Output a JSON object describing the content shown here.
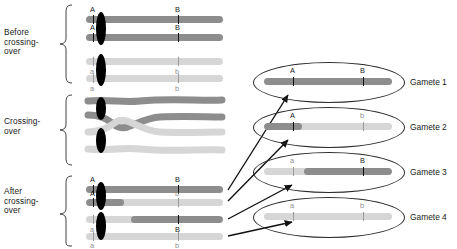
{
  "figure": {
    "type": "meiosis-crossing-over-diagram",
    "stages": [
      {
        "id": "before",
        "label": "Before\ncrossing-\nover"
      },
      {
        "id": "during",
        "label": "Crossing-\nover"
      },
      {
        "id": "after",
        "label": "After\ncrossing-\nover"
      }
    ],
    "loci": [
      {
        "name": "A",
        "dominant": "A",
        "recessive": "a"
      },
      {
        "name": "B",
        "dominant": "B",
        "recessive": "b"
      }
    ],
    "colors": {
      "dark_chromatid": "#8d8d8d",
      "light_chromatid": "#d6d6d6",
      "centromere": "#000000",
      "outline": "#2b2b2b",
      "text": "#1a1a1a",
      "faint_text": "#8e8e8e"
    },
    "before_chromatids": [
      {
        "id": "b1",
        "shade": "dark",
        "allele_a": "A",
        "allele_b": "B",
        "a_label_above": true,
        "b_label_above": true
      },
      {
        "id": "b2",
        "shade": "dark",
        "allele_a": "A",
        "allele_b": "B",
        "a_label_above": true,
        "b_label_above": true
      },
      {
        "id": "b3",
        "shade": "light",
        "allele_a": "a",
        "allele_b": "b",
        "a_label_above": false,
        "b_label_above": false
      },
      {
        "id": "b4",
        "shade": "light",
        "allele_a": "a",
        "allele_b": "b",
        "a_label_above": false,
        "b_label_above": false
      }
    ],
    "after_chromatids": [
      {
        "id": "a1",
        "label_top": "A",
        "label_bottom": "",
        "label_top_right": "B",
        "label_bottom_right": "",
        "description": "parental A B, all dark"
      },
      {
        "id": "a2",
        "label_top": "A",
        "label_bottom": "",
        "label_top_right": "",
        "label_bottom_right": "b",
        "description": "recombinant A b, dark at left, light to the right"
      },
      {
        "id": "a3",
        "label_top": "",
        "label_bottom": "a",
        "label_top_right": "B",
        "label_bottom_right": "",
        "description": "recombinant a B, light at left, dark to the right"
      },
      {
        "id": "a4",
        "label_top": "",
        "label_bottom": "a",
        "label_top_right": "",
        "label_bottom_right": "b",
        "description": "parental a b, all light"
      }
    ],
    "gametes": [
      {
        "id": "g1",
        "label": "Gamete 1",
        "allele_a": "A",
        "allele_b": "B",
        "allele_a_faint": false,
        "allele_b_faint": false,
        "description": "parental A B, fully dark chromosome"
      },
      {
        "id": "g2",
        "label": "Gamete 2",
        "allele_a": "A",
        "allele_b": "b",
        "allele_a_faint": false,
        "allele_b_faint": true,
        "description": "recombinant A b, dark left segment, light right segment"
      },
      {
        "id": "g3",
        "label": "Gamete 3",
        "allele_a": "a",
        "allele_b": "B",
        "allele_a_faint": true,
        "allele_b_faint": false,
        "description": "recombinant a B, light left segment, dark right segment"
      },
      {
        "id": "g4",
        "label": "Gamete 4",
        "allele_a": "a",
        "allele_b": "b",
        "allele_a_faint": true,
        "allele_b_faint": true,
        "description": "parental a b, fully light chromosome"
      }
    ],
    "arrows": [
      {
        "from": "after-chromatid-1",
        "to": "gamete-1"
      },
      {
        "from": "after-chromatid-2",
        "to": "gamete-2"
      },
      {
        "from": "after-chromatid-3",
        "to": "gamete-3"
      },
      {
        "from": "after-chromatid-4",
        "to": "gamete-4"
      }
    ]
  }
}
